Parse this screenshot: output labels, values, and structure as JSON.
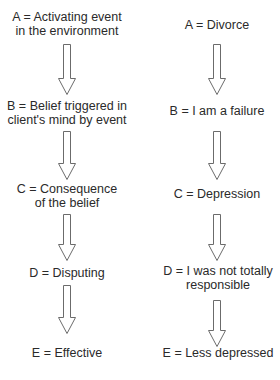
{
  "diagram": {
    "type": "flow",
    "left_column": {
      "steps": [
        {
          "label": "A = Activating event",
          "label2": "in the environment"
        },
        {
          "label": "B = Belief triggered in",
          "label2": "client's mind by event"
        },
        {
          "label": "C = Consequence",
          "label2": "of the belief"
        },
        {
          "label": "D = Disputing",
          "label2": ""
        },
        {
          "label": "E = Effective",
          "label2": ""
        }
      ]
    },
    "right_column": {
      "steps": [
        {
          "label": "A = Divorce",
          "label2": ""
        },
        {
          "label": "B = I am a failure",
          "label2": ""
        },
        {
          "label": "C = Depression",
          "label2": ""
        },
        {
          "label": "D = I was not totally",
          "label2": "responsible"
        },
        {
          "label": "E = Less depressed",
          "label2": ""
        }
      ]
    },
    "arrow_icon": "down-arrow-icon",
    "colors": {
      "arrow_stroke": "#6b6b6b",
      "text": "#2a2a2a",
      "background": "#ffffff"
    }
  }
}
